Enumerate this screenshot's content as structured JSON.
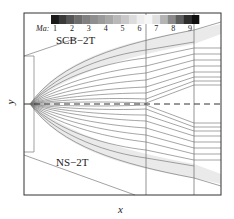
{
  "figure": {
    "x_axis_label": "x",
    "y_axis_label": "y",
    "colorbar": {
      "label": "Ma:",
      "ticks": [
        "1",
        "2",
        "3",
        "4",
        "5",
        "6",
        "7",
        "8",
        "9"
      ],
      "colors": [
        "#1a1a1a",
        "#3a3a3a",
        "#555555",
        "#6d6d6d",
        "#808080",
        "#8e8e8e",
        "#9a9a9a",
        "#a8a8a8",
        "#b8b8b8",
        "#c8c8c8",
        "#dcdcdc",
        "#eeeeee",
        "#f6f6f6",
        "#e0e0e0",
        "#b4b4b4",
        "#8a8a8a",
        "#5e5e5e",
        "#2e2e2e",
        "#0e0e0e"
      ]
    },
    "regions": {
      "upper": "SCB−2T",
      "lower": "NS−2T"
    },
    "colors": {
      "frame": "#333333",
      "streamline": "#555555",
      "centerline": "#333333",
      "shock": "#cfcfcf"
    }
  }
}
